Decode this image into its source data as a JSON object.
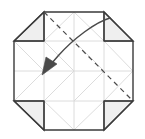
{
  "figure": {
    "type": "origami-fold-diagram",
    "canvas": {
      "width": 145,
      "height": 139
    },
    "background_color": "#ffffff"
  },
  "colors": {
    "outline": "#3a3a3a",
    "crease_light": "#d8d8d8",
    "flap_fill": "#efefef",
    "flap_stroke": "#555555",
    "dashed_line": "#4a4a4a",
    "arrow": "#4a4a4a",
    "paper_fill": "#ffffff"
  },
  "base_square": {
    "left": 14,
    "top": 12,
    "right": 133,
    "bottom": 130,
    "grid_divisions": 4
  },
  "grid_lines": {
    "vertical_x": [
      44,
      74,
      104
    ],
    "horizontal_y": [
      41,
      71,
      101
    ],
    "label": "quarter grid creases"
  },
  "octagon_outline": {
    "points": "44,12 104,12 133,41 133,101 104,130 44,130 14,101 14,41",
    "stroke_width": 1.4
  },
  "corner_flaps": [
    {
      "name": "top-left-flap",
      "triangle": "14,41 44,12 44,41",
      "fill": "#efefef"
    },
    {
      "name": "top-right-flap",
      "triangle": "104,12 133,41 104,41",
      "fill": "#efefef"
    },
    {
      "name": "bottom-left-flap",
      "triangle": "14,101 44,101 44,130",
      "fill": "#efefef"
    },
    {
      "name": "bottom-right-flap",
      "triangle": "104,101 133,101 104,130",
      "fill": "#efefef"
    }
  ],
  "diagonal_creases": [
    "14,41 44,71",
    "44,71 14,101",
    "44,41 74,71",
    "74,71 44,101",
    "74,41 104,71",
    "104,71 74,101",
    "104,41 133,71",
    "133,71 104,101",
    "44,41 74,12",
    "74,12 104,41",
    "44,101 74,130",
    "74,130 104,101",
    "44,41 14,41",
    "104,41 133,41",
    "44,101 14,101",
    "104,101 133,101"
  ],
  "dashed_fold_line": {
    "name": "valley-fold-line",
    "from_x": 44,
    "from_y": 12,
    "to_x": 133,
    "to_y": 101,
    "dash_pattern": "5,4",
    "stroke_width": 1.2
  },
  "fold_arrow": {
    "name": "fold-direction-arrow",
    "path": "M 110,18 C 96,22 74,38 58,56 L 44,72",
    "arrow_head": "44,74 52,58 58,66",
    "stroke_width": 1.5,
    "direction": "top-right to center-left"
  },
  "labels": {
    "alt_text": "Origami diagram: square with four corners folded inward forming an octagon, dashed diagonal fold line, curved arrow indicating fold direction."
  }
}
